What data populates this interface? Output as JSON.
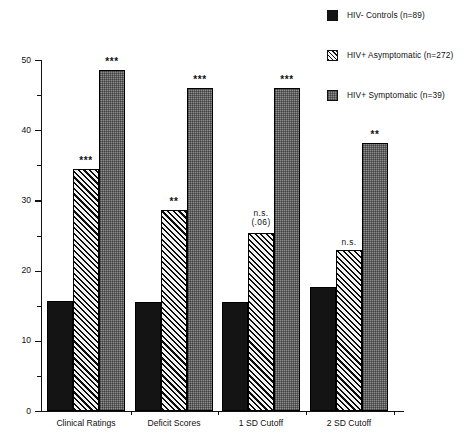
{
  "legend": {
    "position": "top-right",
    "items": [
      {
        "label": "HIV- Controls (n=89)",
        "swatch": "solid-black-swatch",
        "color": "#141414"
      },
      {
        "label": "HIV+ Asymptomatic (n=272)",
        "swatch": "diagonal-hatch-swatch",
        "color": "#5a5a5a"
      },
      {
        "label": "HIV+ Symptomatic (n=39)",
        "swatch": "gray-stipple-swatch",
        "color": "#8e8e8e"
      }
    ]
  },
  "axis": {
    "y_ticks": [
      "50",
      "40",
      "30",
      "20",
      "10",
      "0"
    ],
    "y_minor_ticks": [
      45,
      35,
      25,
      15,
      5
    ],
    "x_labels": [
      "Clinical Ratings",
      "Deficit Scores",
      "1 SD Cutoff",
      "2 SD Cutoff"
    ]
  },
  "annotations": [
    {
      "group": "Clinical Ratings",
      "series": "HIV+ Asymptomatic (n=272)",
      "text": "***"
    },
    {
      "group": "Clinical Ratings",
      "series": "HIV+ Symptomatic (n=39)",
      "text": "***"
    },
    {
      "group": "Deficit Scores",
      "series": "HIV+ Asymptomatic (n=272)",
      "text": "**"
    },
    {
      "group": "Deficit Scores",
      "series": "HIV+ Symptomatic (n=39)",
      "text": "***"
    },
    {
      "group": "1 SD Cutoff",
      "series": "HIV+ Asymptomatic (n=272)",
      "text": "n.s.",
      "text2": "(.06)"
    },
    {
      "group": "1 SD Cutoff",
      "series": "HIV+ Symptomatic (n=39)",
      "text": "***"
    },
    {
      "group": "2 SD Cutoff",
      "series": "HIV+ Asymptomatic (n=272)",
      "text": "n.s."
    },
    {
      "group": "2 SD Cutoff",
      "series": "HIV+ Symptomatic (n=39)",
      "text": "**"
    }
  ],
  "chart_data": {
    "type": "bar",
    "title": "",
    "xlabel": "",
    "ylabel": "",
    "ylim": [
      0,
      50
    ],
    "yticks": [
      0,
      10,
      20,
      30,
      40,
      50
    ],
    "grid": false,
    "legend_position": "top-right",
    "categories": [
      "Clinical Ratings",
      "Deficit Scores",
      "1 SD Cutoff",
      "2 SD Cutoff"
    ],
    "series": [
      {
        "name": "HIV- Controls (n=89)",
        "values": [
          15.7,
          15.6,
          15.5,
          17.6
        ],
        "annotations": [
          "",
          "",
          "",
          ""
        ]
      },
      {
        "name": "HIV+ Asymptomatic (n=272)",
        "values": [
          34.5,
          28.6,
          25.4,
          22.9
        ],
        "annotations": [
          "***",
          "**",
          "n.s. (.06)",
          "n.s."
        ]
      },
      {
        "name": "HIV+ Symptomatic (n=39)",
        "values": [
          48.6,
          46.0,
          46.0,
          38.2
        ],
        "annotations": [
          "***",
          "***",
          "***",
          "**"
        ]
      }
    ]
  }
}
